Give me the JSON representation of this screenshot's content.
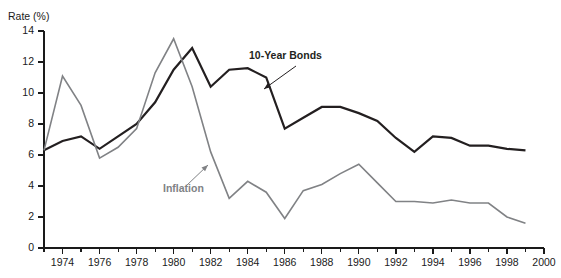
{
  "chart_data": {
    "type": "line",
    "title": "",
    "ylabel": "Rate (%)",
    "xlabel": "",
    "ylim": [
      0,
      14
    ],
    "xlim": [
      1973,
      2000
    ],
    "ytick_labels": [
      "0",
      "2",
      "4",
      "6",
      "8",
      "10",
      "12",
      "14"
    ],
    "ytick_values": [
      0,
      2,
      4,
      6,
      8,
      10,
      12,
      14
    ],
    "xtick_labels": [
      "1974",
      "1976",
      "1978",
      "1980",
      "1982",
      "1984",
      "1986",
      "1988",
      "1990",
      "1992",
      "1994",
      "1996",
      "1998",
      "2000"
    ],
    "xtick_values": [
      1974,
      1976,
      1978,
      1980,
      1982,
      1984,
      1986,
      1988,
      1990,
      1992,
      1994,
      1996,
      1998,
      2000
    ],
    "x_minor_step": 1,
    "grid": false,
    "legend_position": "inline-annotations",
    "x": [
      1973,
      1974,
      1975,
      1976,
      1977,
      1978,
      1979,
      1980,
      1981,
      1982,
      1983,
      1984,
      1985,
      1986,
      1987,
      1988,
      1989,
      1990,
      1991,
      1992,
      1993,
      1994,
      1995,
      1996,
      1997,
      1998,
      1999
    ],
    "series": [
      {
        "name": "10-Year Bonds",
        "color": "#231f20",
        "width": 2.2,
        "values": [
          6.3,
          6.9,
          7.2,
          6.4,
          7.2,
          8.0,
          9.4,
          11.5,
          12.9,
          10.4,
          11.5,
          11.6,
          11.0,
          7.7,
          8.4,
          9.1,
          9.1,
          8.7,
          8.2,
          7.1,
          6.2,
          7.2,
          7.1,
          6.6,
          6.6,
          6.4,
          6.3
        ]
      },
      {
        "name": "Inflation",
        "color": "#808285",
        "width": 1.6,
        "values": [
          6.3,
          11.1,
          9.2,
          5.8,
          6.5,
          7.7,
          11.3,
          13.5,
          10.4,
          6.2,
          3.2,
          4.3,
          3.6,
          1.9,
          3.7,
          4.1,
          4.8,
          5.4,
          4.2,
          3.0,
          3.0,
          2.9,
          3.1,
          2.9,
          2.9,
          2.0,
          1.6
        ]
      }
    ],
    "annotations": [
      {
        "text": "10-Year Bonds",
        "color": "#231f20",
        "label_x": 249,
        "label_y": 59,
        "leader_from_x": 296,
        "leader_from_y": 66,
        "leader_to_x": 264,
        "leader_to_y": 89
      },
      {
        "text": "Inflation",
        "color": "#808285",
        "label_x": 163,
        "label_y": 192,
        "leader_from_x": 186,
        "leader_from_y": 186,
        "leader_to_x": 208,
        "leader_to_y": 165
      }
    ]
  },
  "geometry": {
    "plot_left": 44,
    "plot_right": 544,
    "plot_top": 31,
    "plot_bottom": 248,
    "ylabel_x": 8,
    "ylabel_y": 12
  }
}
